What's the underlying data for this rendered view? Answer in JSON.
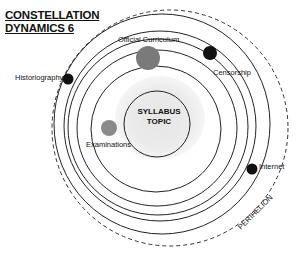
{
  "title": {
    "line1": "CONSTELLATION",
    "line2": "DYNAMICS 6"
  },
  "center": {
    "line1": "SYLLABUS",
    "line2": "TOPIC"
  },
  "bodies": [
    {
      "label": "Official Curriculum",
      "color": "#7a7a7a",
      "size": "large"
    },
    {
      "label": "Censorship",
      "color": "#111111",
      "size": "medium"
    },
    {
      "label": "Historiography",
      "color": "#111111",
      "size": "small"
    },
    {
      "label": "Examinations",
      "color": "#8a8a8a",
      "size": "medium"
    },
    {
      "label": "Internet",
      "color": "#111111",
      "size": "small"
    }
  ],
  "boundary": {
    "label": "PERIHELION"
  }
}
